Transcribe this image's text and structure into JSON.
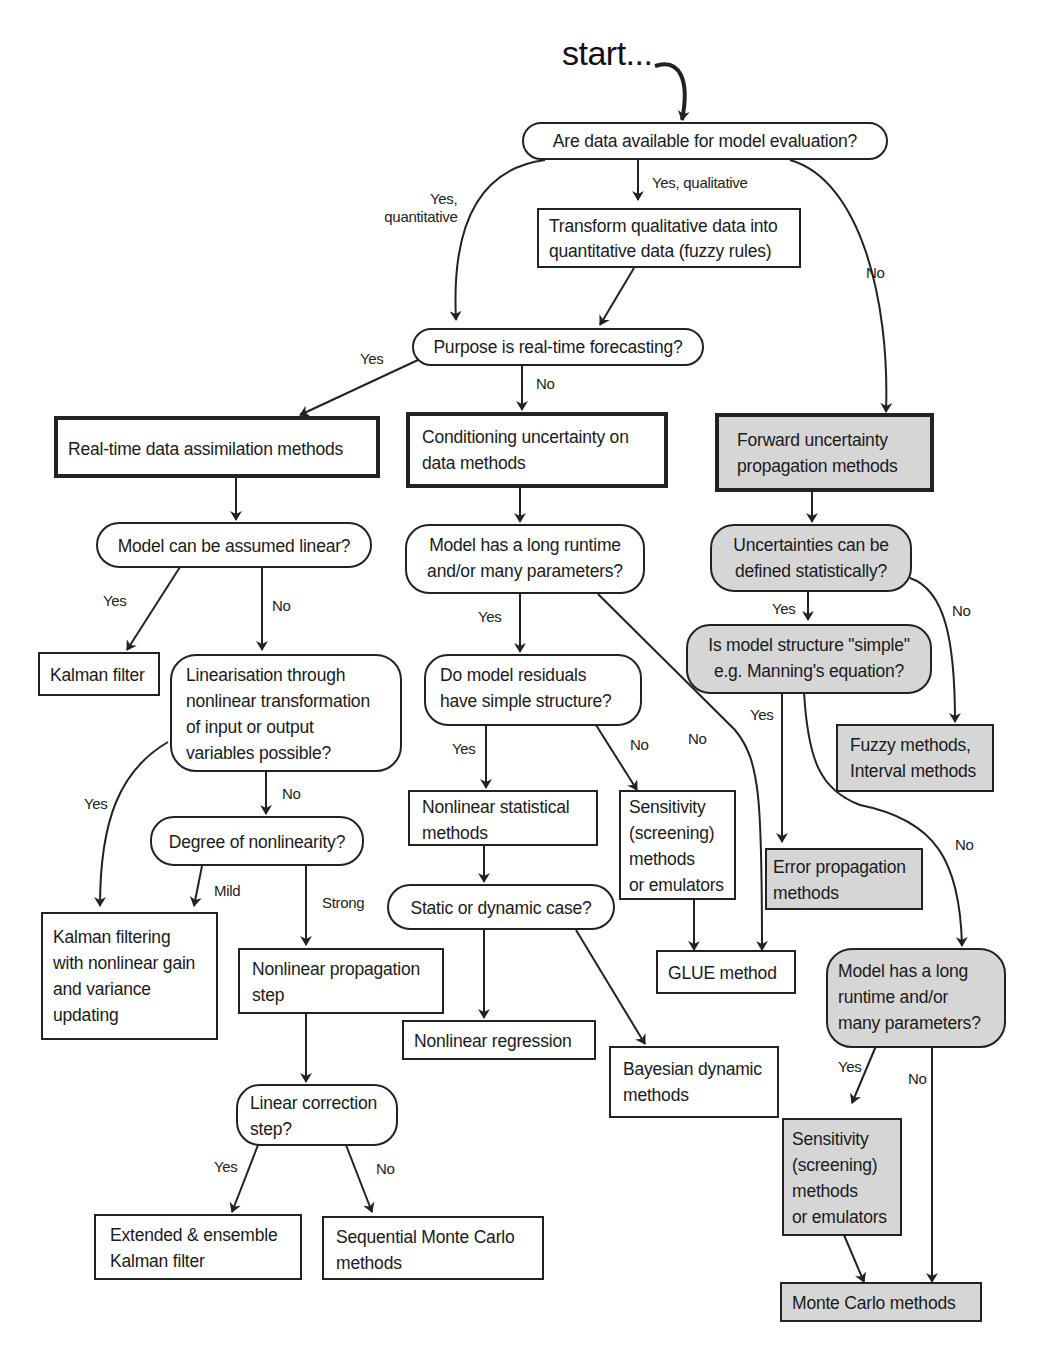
{
  "start": "start...",
  "colors": {
    "line": "#222222",
    "grey_fill": "#d6d6d6",
    "white_fill": "#ffffff"
  },
  "nodes": {
    "q_data_available": "Are data available for model evaluation?",
    "transform_qualitative": [
      "Transform qualitative data into",
      "quantitative data (fuzzy rules)"
    ],
    "q_realtime": "Purpose is real-time forecasting?",
    "realtime_assimilation": "Real-time data assimilation methods",
    "conditioning": [
      "Conditioning uncertainty on",
      "data methods"
    ],
    "forward_propagation": [
      "Forward uncertainty",
      "propagation methods"
    ],
    "q_linear": "Model can be assumed linear?",
    "kalman_filter": "Kalman filter",
    "q_linearisation": [
      "Linearisation through",
      "nonlinear transformation",
      "of input or output",
      "variables possible?"
    ],
    "q_degree_nonlinearity": "Degree of nonlinearity?",
    "kalman_nonlinear_gain": [
      "Kalman filtering",
      "with nonlinear gain",
      "and variance",
      "updating"
    ],
    "nonlinear_propagation": [
      "Nonlinear propagation",
      "step"
    ],
    "q_linear_correction": [
      "Linear correction",
      "step?"
    ],
    "extended_ensemble_kalman": [
      "Extended & ensemble",
      "Kalman filter"
    ],
    "sequential_monte_carlo": [
      "Sequential Monte Carlo",
      "methods"
    ],
    "q_long_runtime_mid": [
      "Model has a long runtime",
      "and/or many parameters?"
    ],
    "q_residuals": [
      "Do model residuals",
      "have simple structure?"
    ],
    "nonlinear_statistical": [
      "Nonlinear statistical",
      "methods"
    ],
    "sensitivity_mid": [
      "Sensitivity",
      "(screening)",
      "methods",
      "or emulators"
    ],
    "q_static_dynamic": "Static or dynamic case?",
    "glue": "GLUE method",
    "nonlinear_regression": "Nonlinear regression",
    "bayesian_dynamic": [
      "Bayesian dynamic",
      "methods"
    ],
    "q_statistical": [
      "Uncertainties can be",
      "defined statistically?"
    ],
    "q_simple_structure": [
      "Is model structure \"simple\"",
      "e.g. Manning's equation?"
    ],
    "fuzzy_interval": [
      "Fuzzy methods,",
      "Interval methods"
    ],
    "error_propagation": [
      "Error propagation",
      "methods"
    ],
    "q_long_runtime_right": [
      "Model has a long",
      "runtime and/or",
      "many parameters?"
    ],
    "sensitivity_right": [
      "Sensitivity",
      "(screening)",
      "methods",
      "or emulators"
    ],
    "monte_carlo": "Monte Carlo methods"
  },
  "edge_labels": {
    "yes_quantitative": [
      "Yes,",
      "quantitative"
    ],
    "yes_qualitative": "Yes, qualitative",
    "no_data": "No",
    "realtime_yes": "Yes",
    "realtime_no": "No",
    "linear_yes": "Yes",
    "linear_no": "No",
    "linearisation_yes": "Yes",
    "linearisation_no": "No",
    "mild": "Mild",
    "strong": "Strong",
    "correction_yes": "Yes",
    "correction_no": "No",
    "runtime_mid_yes": "Yes",
    "runtime_mid_no": "No",
    "residuals_yes": "Yes",
    "residuals_no": "No",
    "statistical_yes": "Yes",
    "statistical_no": "No",
    "simple_yes": "Yes",
    "simple_no": "No",
    "runtime_right_yes": "Yes",
    "runtime_right_no": "No"
  }
}
